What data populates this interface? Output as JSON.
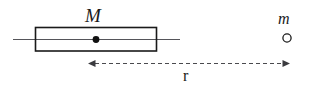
{
  "figure": {
    "background_color": "#ffffff",
    "stroke_color": "#1a1a1a",
    "axis_color": "#55555a",
    "width": 316,
    "height": 89
  },
  "labels": {
    "rod_mass": "M",
    "point_mass": "m",
    "distance": "r"
  },
  "shapes": {
    "rod": {
      "name": "rod-rectangle",
      "x": 35,
      "y": 27,
      "width": 122,
      "height": 24,
      "stroke_width": 1.6,
      "fill": "none"
    },
    "axis_line": {
      "name": "horizontal-axis-line",
      "x1": 13,
      "y1": 39,
      "x2": 180,
      "y2": 39,
      "stroke_width": 1.0
    },
    "rod_midline": {
      "name": "rod-center-line",
      "x1": 35,
      "y1": 39,
      "x2": 157,
      "y2": 39,
      "stroke_width": 1.0
    },
    "center_dot": {
      "name": "rod-center-of-mass-dot",
      "cx": 96,
      "cy": 39,
      "r": 3.4,
      "fill": "#111111"
    },
    "point_mass_circle": {
      "name": "point-mass-circle",
      "cx": 287,
      "cy": 38,
      "r": 4.1,
      "stroke_width": 1.3,
      "fill": "none"
    },
    "distance_arrow": {
      "name": "distance-dimension-arrow",
      "x1": 88,
      "y1": 63,
      "x2": 290,
      "y2": 63,
      "stroke_width": 1.2,
      "dash_pattern": "4 3",
      "arrowheads": "both",
      "arrowhead_length": 7,
      "arrowhead_half_width": 3.6
    }
  }
}
